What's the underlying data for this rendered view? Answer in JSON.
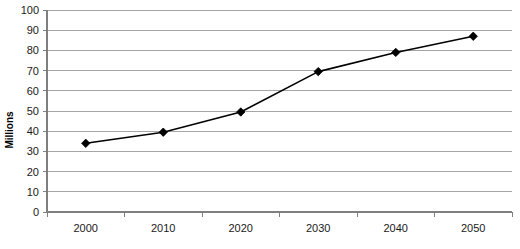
{
  "chart_data": {
    "type": "line",
    "title": "",
    "xlabel": "",
    "ylabel": "Millions",
    "categories": [
      "2000",
      "2010",
      "2020",
      "2030",
      "2040",
      "2050"
    ],
    "values": [
      34,
      39.5,
      49.5,
      69.5,
      79,
      87
    ],
    "series": [
      {
        "name": "",
        "values": [
          34,
          39.5,
          49.5,
          69.5,
          79,
          87
        ]
      }
    ],
    "ylim": [
      0,
      100
    ],
    "y_ticks": [
      0,
      10,
      20,
      30,
      40,
      50,
      60,
      70,
      80,
      90,
      100
    ],
    "y_tick_labels": [
      "0",
      "10",
      "20",
      "30",
      "40",
      "50",
      "60",
      "70",
      "80",
      "90",
      "100"
    ],
    "grid": true,
    "grid_axis": "y",
    "legend": false,
    "legend_position": "none",
    "marker": "diamond",
    "line_color": "#000000",
    "marker_color": "#000000",
    "grid_color": "#a6a6a6",
    "axis_color": "#7f7f7f",
    "background_color": "#ffffff"
  }
}
